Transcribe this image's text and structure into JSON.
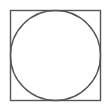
{
  "diagram": {
    "title": "",
    "shapes": [
      {
        "type": "square",
        "x": 10.5,
        "y": 10.5,
        "size": 90,
        "stroke": "#555555",
        "stroke_width": 1.4,
        "fill": "none"
      },
      {
        "type": "circle",
        "cx": 55.5,
        "cy": 55.5,
        "r": 45,
        "stroke": "#555555",
        "stroke_width": 1.4,
        "fill": "none"
      }
    ]
  }
}
